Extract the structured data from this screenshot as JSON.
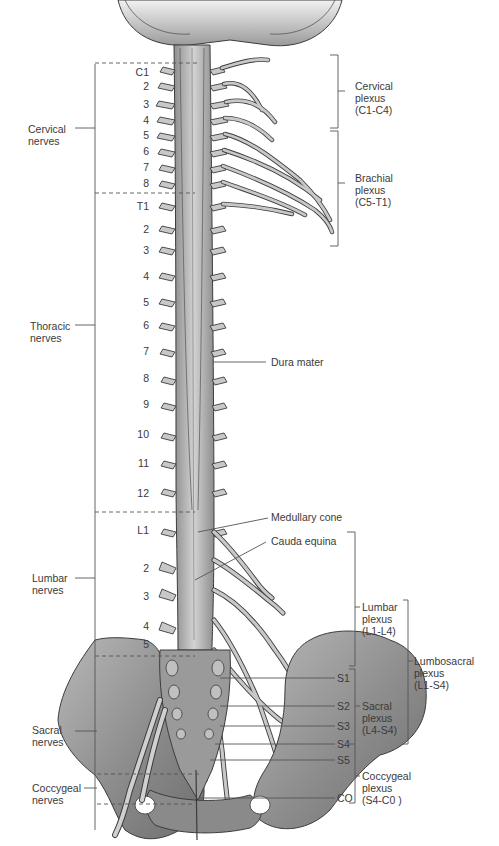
{
  "regions": {
    "cervical": "Cervical\nnerves",
    "thoracic": "Thoracic\nnerves",
    "lumbar": "Lumbar\nnerves",
    "sacral": "Sacral\nnerves",
    "coccygeal": "Coccygeal\nnerves"
  },
  "region_labels": [
    {
      "line1": "Cervical",
      "line2": "nerves"
    },
    {
      "line1": "Thoracic",
      "line2": "nerves"
    },
    {
      "line1": "Lumbar",
      "line2": "nerves"
    },
    {
      "line1": "Sacral",
      "line2": "nerves"
    },
    {
      "line1": "Coccygeal",
      "line2": "nerves"
    }
  ],
  "segment_numbers": {
    "cervical": [
      "C1",
      "2",
      "3",
      "4",
      "5",
      "6",
      "7",
      "8"
    ],
    "thoracic": [
      "T1",
      "2",
      "3",
      "4",
      "5",
      "6",
      "7",
      "8",
      "9",
      "10",
      "11",
      "12"
    ],
    "lumbar": [
      "L1",
      "2",
      "3",
      "4",
      "5"
    ]
  },
  "sacral_segments": [
    "S1",
    "S2",
    "S3",
    "S4",
    "S5",
    "CO"
  ],
  "structures": {
    "dura_mater": "Dura mater",
    "medullary_cone": "Medullary cone",
    "cauda_equina": "Cauda equina"
  },
  "plexuses": [
    {
      "name": "Cervical",
      "word": "plexus",
      "range": "(C1-C4)"
    },
    {
      "name": "Brachial",
      "word": "plexus",
      "range": "(C5-T1)"
    },
    {
      "name": "Lumbar",
      "word": "plexus",
      "range": "(L1-L4)"
    },
    {
      "name": "Lumbosacral",
      "word": "plexus",
      "range": "(L1-S4)"
    },
    {
      "name": "Sacral",
      "word": "plexus",
      "range": "(L4-S4)"
    },
    {
      "name": "Coccygeal",
      "word": "plexus",
      "range": "(S4-C0 )"
    }
  ],
  "colors": {
    "bone": "#8a8a8a",
    "nerve": "#c8c8c8",
    "outline": "#3c3c3c",
    "text": "#3a3a3a",
    "line": "#555555"
  }
}
